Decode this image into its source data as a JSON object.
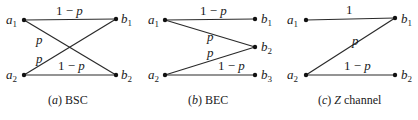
{
  "figure": {
    "panels": [
      {
        "id": "bsc",
        "caption_prefix": "(a)",
        "caption_letter": "a",
        "caption_text": "BSC",
        "inputs": [
          "a1",
          "a2"
        ],
        "outputs": [
          "b1",
          "b2"
        ],
        "edges": [
          {
            "from": "a1",
            "to": "b1",
            "label": "1 − p"
          },
          {
            "from": "a1",
            "to": "b2",
            "label": "p"
          },
          {
            "from": "a2",
            "to": "b1",
            "label": "p"
          },
          {
            "from": "a2",
            "to": "b2",
            "label": "1 − p"
          }
        ]
      },
      {
        "id": "bec",
        "caption_prefix": "(b)",
        "caption_letter": "b",
        "caption_text": "BEC",
        "inputs": [
          "a1",
          "a2"
        ],
        "outputs": [
          "b1",
          "b2",
          "b3"
        ],
        "edges": [
          {
            "from": "a1",
            "to": "b1",
            "label": "1 − p"
          },
          {
            "from": "a1",
            "to": "b2",
            "label": "p"
          },
          {
            "from": "a2",
            "to": "b2",
            "label": "p"
          },
          {
            "from": "a2",
            "to": "b3",
            "label": "1 − p"
          }
        ]
      },
      {
        "id": "z",
        "caption_prefix": "(c)",
        "caption_letter": "c",
        "caption_text": "Z channel",
        "inputs": [
          "a1",
          "a2"
        ],
        "outputs": [
          "b1",
          "b2"
        ],
        "edges": [
          {
            "from": "a1",
            "to": "b1",
            "label": "1"
          },
          {
            "from": "a2",
            "to": "b1",
            "label": "p"
          },
          {
            "from": "a2",
            "to": "b2",
            "label": "1 − p"
          }
        ]
      }
    ],
    "symbols": {
      "a": "a",
      "b": "b",
      "sub1": "1",
      "sub2": "2",
      "sub3": "3",
      "one_minus_p_one": "1 − ",
      "p": "p",
      "one": "1",
      "open": "(",
      "close": ")"
    }
  }
}
